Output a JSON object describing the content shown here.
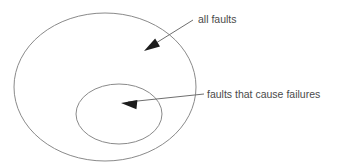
{
  "diagram": {
    "type": "venn-nested-ellipses",
    "title": "",
    "background_color": "#ffffff",
    "outline_color": "#8a8a8a",
    "line_color": "#6f6f6f",
    "arrow_color": "#1c1c1c",
    "text_color": "#4a4a4a",
    "sets": [
      {
        "id": "all-faults",
        "label": "all faults",
        "shape": "ellipse",
        "cx": 105,
        "cy": 87,
        "rx": 91,
        "ry": 74
      },
      {
        "id": "faults-that-cause-failures",
        "label": "faults that cause failures",
        "shape": "ellipse",
        "cx": 119,
        "cy": 114,
        "rx": 43,
        "ry": 30
      }
    ],
    "annotations": [
      {
        "id": "annotation-all-faults",
        "text": "all faults",
        "text_x": 198,
        "text_y": 23,
        "line_from_x": 193,
        "line_from_y": 20,
        "line_to_x": 148,
        "line_to_y": 48,
        "arrow_tip_x": 144,
        "arrow_tip_y": 51,
        "arrow_angle_deg": 148
      },
      {
        "id": "annotation-faults-that-cause-failures",
        "text": "faults that cause failures",
        "text_x": 207,
        "text_y": 98,
        "line_from_x": 204,
        "line_from_y": 94,
        "line_to_x": 128,
        "line_to_y": 102,
        "arrow_tip_x": 121,
        "arrow_tip_y": 103,
        "arrow_angle_deg": 186
      }
    ]
  }
}
